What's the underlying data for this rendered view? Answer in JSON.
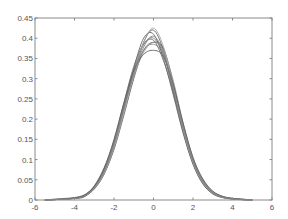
{
  "chart_data": {
    "type": "line",
    "title": "",
    "xlabel": "",
    "ylabel": "",
    "xlim": [
      -6,
      6
    ],
    "ylim": [
      0,
      0.45
    ],
    "xticks": [
      -6,
      -4,
      -2,
      0,
      2,
      4,
      6
    ],
    "xtick_labels": [
      "-6",
      "-4",
      "-2",
      "0",
      "2",
      "4",
      "6"
    ],
    "yticks": [
      0,
      0.05,
      0.1,
      0.15,
      0.2,
      0.25,
      0.3,
      0.35,
      0.4,
      0.45
    ],
    "ytick_labels": [
      "0",
      "0.05",
      "0.1",
      "0.15",
      "0.2",
      "0.25",
      "0.3",
      "0.35",
      "0.4",
      "0.45"
    ],
    "grid": false,
    "legend": null,
    "x": [
      -5.5,
      -5,
      -4.5,
      -4,
      -3.5,
      -3,
      -2.5,
      -2,
      -1.5,
      -1,
      -0.5,
      0,
      0.5,
      1,
      1.5,
      2,
      2.5,
      3,
      3.5,
      4,
      4.5,
      5
    ],
    "series": [
      {
        "name": "density 1",
        "color": "#6a6a6a",
        "values": [
          0.0,
          0.002,
          0.003,
          0.004,
          0.008,
          0.03,
          0.07,
          0.13,
          0.22,
          0.31,
          0.39,
          0.42,
          0.37,
          0.27,
          0.17,
          0.09,
          0.04,
          0.015,
          0.006,
          0.003,
          0.001,
          0.0
        ]
      },
      {
        "name": "density 2",
        "color": "#7a7a7a",
        "values": [
          0.0,
          0.001,
          0.002,
          0.005,
          0.012,
          0.035,
          0.08,
          0.145,
          0.235,
          0.32,
          0.385,
          0.4,
          0.36,
          0.27,
          0.175,
          0.095,
          0.045,
          0.018,
          0.007,
          0.003,
          0.001,
          0.0
        ]
      },
      {
        "name": "density 3",
        "color": "#5a5a5a",
        "values": [
          0.0,
          0.001,
          0.002,
          0.004,
          0.01,
          0.028,
          0.065,
          0.125,
          0.21,
          0.3,
          0.37,
          0.39,
          0.375,
          0.29,
          0.185,
          0.1,
          0.048,
          0.02,
          0.008,
          0.003,
          0.001,
          0.0
        ]
      },
      {
        "name": "density 4",
        "color": "#8a8a8a",
        "values": [
          0.0,
          0.001,
          0.003,
          0.006,
          0.013,
          0.032,
          0.072,
          0.14,
          0.23,
          0.315,
          0.37,
          0.385,
          0.36,
          0.28,
          0.18,
          0.1,
          0.05,
          0.02,
          0.008,
          0.004,
          0.002,
          0.0
        ]
      },
      {
        "name": "density 5",
        "color": "#666666",
        "values": [
          0.0,
          0.001,
          0.002,
          0.004,
          0.009,
          0.027,
          0.064,
          0.13,
          0.225,
          0.325,
          0.4,
          0.41,
          0.35,
          0.26,
          0.165,
          0.088,
          0.04,
          0.016,
          0.006,
          0.002,
          0.001,
          0.0
        ]
      },
      {
        "name": "density 6",
        "color": "#9a9a9a",
        "values": [
          0.0,
          0.002,
          0.004,
          0.006,
          0.011,
          0.03,
          0.068,
          0.135,
          0.22,
          0.305,
          0.365,
          0.39,
          0.37,
          0.295,
          0.19,
          0.105,
          0.05,
          0.021,
          0.009,
          0.004,
          0.002,
          0.0
        ]
      },
      {
        "name": "density 7",
        "color": "#707070",
        "values": [
          0.0,
          0.001,
          0.002,
          0.005,
          0.011,
          0.033,
          0.076,
          0.145,
          0.24,
          0.33,
          0.385,
          0.395,
          0.345,
          0.265,
          0.17,
          0.092,
          0.043,
          0.017,
          0.007,
          0.003,
          0.001,
          0.0
        ]
      },
      {
        "name": "density 8",
        "color": "#a5a5a5",
        "values": [
          0.0,
          0.001,
          0.002,
          0.004,
          0.01,
          0.029,
          0.066,
          0.128,
          0.215,
          0.31,
          0.39,
          0.425,
          0.38,
          0.28,
          0.175,
          0.093,
          0.043,
          0.017,
          0.007,
          0.003,
          0.001,
          0.0
        ]
      },
      {
        "name": "density 9",
        "color": "#606060",
        "values": [
          0.0,
          0.001,
          0.003,
          0.005,
          0.012,
          0.034,
          0.078,
          0.15,
          0.24,
          0.32,
          0.36,
          0.37,
          0.355,
          0.285,
          0.19,
          0.105,
          0.052,
          0.022,
          0.009,
          0.004,
          0.002,
          0.0
        ]
      },
      {
        "name": "density 10",
        "color": "#808080",
        "values": [
          0.0,
          0.001,
          0.002,
          0.004,
          0.01,
          0.031,
          0.07,
          0.138,
          0.228,
          0.312,
          0.378,
          0.405,
          0.365,
          0.275,
          0.178,
          0.097,
          0.046,
          0.018,
          0.007,
          0.003,
          0.001,
          0.0
        ]
      }
    ]
  },
  "layout": {
    "plot_left": 35,
    "plot_right": 272,
    "plot_top": 18,
    "plot_bottom": 200
  }
}
